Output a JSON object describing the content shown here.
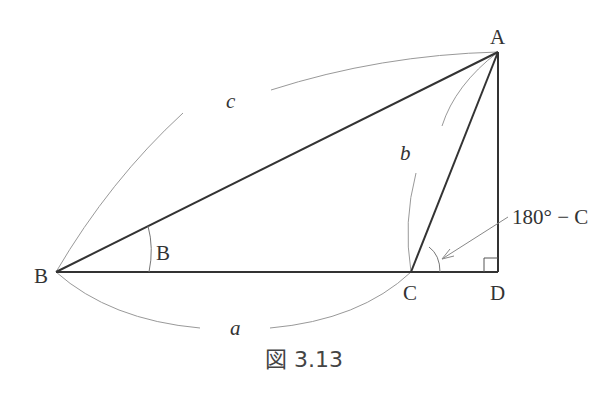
{
  "figure": {
    "caption": "図 3.13",
    "points": {
      "A": {
        "label": "A",
        "x": 498,
        "y": 52
      },
      "B": {
        "label": "B",
        "x": 56,
        "y": 272
      },
      "C": {
        "label": "C",
        "x": 411,
        "y": 272
      },
      "D": {
        "label": "D",
        "x": 498,
        "y": 272
      }
    },
    "sides": {
      "a": "a",
      "b": "b",
      "c": "c"
    },
    "angles": {
      "B": "B",
      "exterior_C": "180° − C"
    },
    "right_angle_at": "D",
    "colors": {
      "edge": "#333333",
      "arc": "#888888",
      "text": "#333333"
    }
  }
}
